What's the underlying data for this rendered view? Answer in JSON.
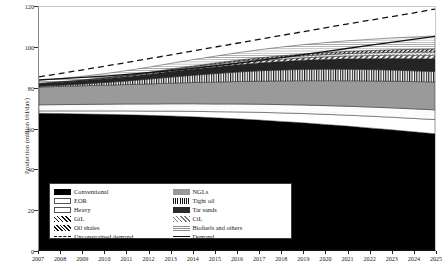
{
  "chart_data": {
    "type": "area",
    "title": "",
    "xlabel": "",
    "ylabel": "Production (million bbl/day)",
    "ylim": [
      0,
      120
    ],
    "yticks": [
      0,
      20,
      40,
      60,
      80,
      100,
      120
    ],
    "grid": false,
    "legend_position": "bottom-left",
    "x": [
      2007,
      2008,
      2009,
      2010,
      2011,
      2012,
      2013,
      2014,
      2015,
      2016,
      2017,
      2018,
      2019,
      2020,
      2021,
      2022,
      2023,
      2024,
      2025
    ],
    "xticklabels": [
      "2007",
      "2008",
      "2009",
      "2010",
      "2011",
      "2012",
      "2013",
      "2014",
      "2015",
      "2016",
      "2017",
      "2018",
      "2019",
      "2020",
      "2021",
      "2022",
      "2023",
      "2024",
      "2025"
    ],
    "stack_order": [
      "Conventional",
      "EOR",
      "Heavy",
      "NGLs",
      "Tight oil",
      "Tar sands",
      "GtL",
      "CtL",
      "Oil shales",
      "Biofuels and others"
    ],
    "series": [
      {
        "name": "Conventional",
        "pattern": "solid-black",
        "color": "#000000",
        "values": [
          67.5,
          67.4,
          67.2,
          67.0,
          66.8,
          66.5,
          66.2,
          65.8,
          65.3,
          64.8,
          64.2,
          63.5,
          62.8,
          62.0,
          61.2,
          60.3,
          59.4,
          58.4,
          57.4
        ]
      },
      {
        "name": "EOR",
        "pattern": "white",
        "color": "#ffffff",
        "values": [
          1.2,
          1.3,
          1.5,
          1.7,
          1.9,
          2.1,
          2.4,
          2.7,
          3.0,
          3.4,
          3.8,
          4.2,
          4.6,
          5.0,
          5.4,
          5.8,
          6.2,
          6.6,
          7.0
        ]
      },
      {
        "name": "Heavy",
        "pattern": "light-dotted",
        "color": "#eeeeee",
        "values": [
          3.0,
          3.1,
          3.2,
          3.3,
          3.4,
          3.5,
          3.6,
          3.7,
          3.8,
          3.9,
          4.0,
          4.1,
          4.2,
          4.3,
          4.4,
          4.5,
          4.6,
          4.7,
          4.8
        ]
      },
      {
        "name": "NGLs",
        "pattern": "grey",
        "color": "#9a9a9a",
        "values": [
          8.8,
          9.0,
          9.2,
          9.4,
          9.6,
          9.9,
          10.2,
          10.5,
          10.8,
          11.1,
          11.4,
          11.7,
          12.0,
          12.3,
          12.6,
          12.9,
          13.2,
          13.5,
          13.8
        ]
      },
      {
        "name": "Tight oil",
        "pattern": "vertical-hatch",
        "color": "#555555",
        "values": [
          0.4,
          0.6,
          0.9,
          1.3,
          1.8,
          2.4,
          3.0,
          3.6,
          4.2,
          4.7,
          5.1,
          5.4,
          5.6,
          5.7,
          5.7,
          5.6,
          5.5,
          5.3,
          5.1
        ]
      },
      {
        "name": "Tar sands",
        "pattern": "dark",
        "color": "#2b2b2b",
        "values": [
          1.3,
          1.5,
          1.7,
          1.9,
          2.1,
          2.4,
          2.7,
          3.0,
          3.3,
          3.6,
          3.9,
          4.2,
          4.5,
          4.8,
          5.1,
          5.4,
          5.7,
          6.0,
          6.3
        ]
      },
      {
        "name": "GtL",
        "pattern": "diagonal-hatch",
        "color": "#777777",
        "values": [
          0.1,
          0.15,
          0.2,
          0.3,
          0.4,
          0.5,
          0.6,
          0.7,
          0.8,
          0.9,
          1.0,
          1.1,
          1.2,
          1.3,
          1.4,
          1.5,
          1.6,
          1.7,
          1.8
        ]
      },
      {
        "name": "CtL",
        "pattern": "cross-hatch",
        "color": "#888888",
        "values": [
          0.1,
          0.12,
          0.15,
          0.2,
          0.25,
          0.3,
          0.4,
          0.5,
          0.6,
          0.7,
          0.8,
          0.9,
          1.0,
          1.1,
          1.2,
          1.3,
          1.4,
          1.5,
          1.6
        ]
      },
      {
        "name": "Oil shales",
        "pattern": "diagonal-hatch-dense",
        "color": "#666666",
        "values": [
          0.0,
          0.0,
          0.05,
          0.1,
          0.15,
          0.2,
          0.3,
          0.4,
          0.5,
          0.6,
          0.7,
          0.8,
          0.9,
          1.0,
          1.1,
          1.2,
          1.3,
          1.4,
          1.5
        ]
      },
      {
        "name": "Biofuels and others",
        "pattern": "fine-dots",
        "color": "#bdbdbd",
        "values": [
          1.3,
          1.5,
          1.7,
          1.9,
          2.2,
          2.5,
          2.8,
          3.1,
          3.4,
          3.7,
          4.0,
          4.3,
          4.6,
          4.9,
          5.2,
          5.5,
          5.8,
          6.1,
          6.4
        ]
      }
    ],
    "lines": [
      {
        "name": "Unconstrained demand",
        "style": "dashed",
        "color": "#111111",
        "values": [
          85.5,
          87.2,
          89.0,
          90.8,
          92.6,
          94.5,
          96.4,
          98.3,
          100.2,
          102.1,
          104.0,
          105.9,
          107.8,
          109.7,
          111.6,
          113.4,
          115.2,
          117.0,
          119.0
        ]
      },
      {
        "name": "Demand",
        "style": "solid",
        "color": "#111111",
        "values": [
          84.0,
          84.6,
          85.2,
          85.9,
          86.7,
          87.6,
          88.6,
          89.7,
          90.9,
          92.2,
          93.6,
          95.0,
          96.5,
          98.0,
          99.5,
          101.0,
          102.5,
          104.0,
          105.5
        ]
      }
    ],
    "legend_entries": [
      {
        "label": "Conventional",
        "type": "patch",
        "fill": "f-conventional"
      },
      {
        "label": "NGLs",
        "type": "patch",
        "fill": "f-ngls"
      },
      {
        "label": "EOR",
        "type": "patch",
        "fill": "f-eor"
      },
      {
        "label": "Tight oil",
        "type": "patch",
        "fill": "f-tightoil"
      },
      {
        "label": "Heavy",
        "type": "patch",
        "fill": "f-heavy"
      },
      {
        "label": "Tar sands",
        "type": "patch",
        "fill": "f-tarsands"
      },
      {
        "label": "GtL",
        "type": "patch",
        "fill": "f-gtl"
      },
      {
        "label": "CtL",
        "type": "patch",
        "fill": "f-ctl"
      },
      {
        "label": "Oil shales",
        "type": "patch",
        "fill": "f-oilshales"
      },
      {
        "label": "Biofuels and others",
        "type": "patch",
        "fill": "f-biofuels"
      },
      {
        "label": "Unconstrained demand",
        "type": "line",
        "fill": "l-unconstrained"
      },
      {
        "label": "Demand",
        "type": "line",
        "fill": "l-demand"
      }
    ]
  }
}
